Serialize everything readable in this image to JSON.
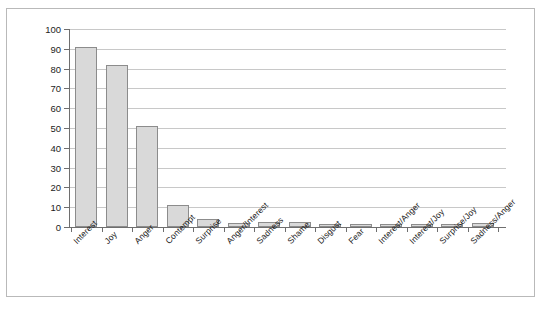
{
  "chart_data": {
    "type": "bar",
    "title": "",
    "subtitle": "",
    "xlabel": "",
    "ylabel": "",
    "ylim": [
      0,
      100
    ],
    "ytick_step": 10,
    "ytick_labels": [
      "0",
      "10",
      "20",
      "30",
      "40",
      "50",
      "60",
      "70",
      "80",
      "90",
      "100"
    ],
    "grid": "horizontal",
    "legend": "none",
    "bar_color": "#d9d9d9",
    "bar_border_color": "#8c8c8c",
    "axis_color": "#6e6e6e",
    "grid_color": "#c8c8c8",
    "frame_color": "#b9b9b9",
    "categories": [
      "Interest",
      "Joy",
      "Anger",
      "Contempt",
      "Surprise",
      "Anger/Interest",
      "Sadness",
      "Shame",
      "Disgust",
      "Fear",
      "Interest/Anger",
      "Interest/Joy",
      "Surprise/Joy",
      "Sadness/Anger"
    ],
    "values": [
      91,
      82,
      51,
      11,
      4,
      2,
      2.5,
      2.5,
      1.5,
      1.5,
      1.5,
      1.5,
      1.5,
      2
    ]
  }
}
